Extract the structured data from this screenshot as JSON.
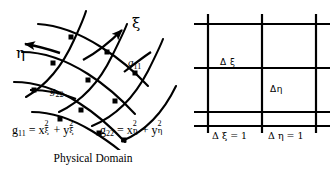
{
  "figure": {
    "background_color": "#ffffff",
    "ink_color": "#000000"
  },
  "physical_domain": {
    "caption": "Physical Domain",
    "axis_labels": {
      "xi": "ξ",
      "eta": "η"
    },
    "metric_labels": {
      "g11": "g",
      "g11_sub": "11",
      "g22": "g",
      "g22_sub": "22"
    },
    "grid": {
      "type": "curvilinear",
      "xi_lines": 4,
      "eta_lines": 4,
      "node_marker": "square"
    },
    "arrows": {
      "xi_direction": "up-right",
      "eta_direction": "left"
    }
  },
  "computational_space": {
    "caption": "Computational Space",
    "grid": {
      "type": "cartesian-uniform",
      "vertical_lines": 3,
      "horizontal_lines": 4
    },
    "spacing_labels": {
      "delta_xi": "Δ ξ",
      "delta_eta": "Δη"
    },
    "axis_equations": {
      "delta_xi_eq": "Δ ξ = 1",
      "delta_eta_eq": "Δ η = 1"
    }
  },
  "formulas": {
    "g11": {
      "lhs": "g",
      "lhs_sub": "11",
      "equals": "=",
      "term1_var": "x",
      "term1_sup": "2",
      "term1_sub": "ξ",
      "plus": "+",
      "term2_var": "y",
      "term2_sup": "2",
      "term2_sub": "ξ",
      "plain": "g11 = x²ξ + y²ξ"
    },
    "g22": {
      "lhs": "g",
      "lhs_sub": "22",
      "equals": "=",
      "term1_var": "x",
      "term1_sup": "2",
      "term1_sub": "η",
      "plus": "+",
      "term2_var": "y",
      "term2_sup": "2",
      "term2_sub": "η",
      "plain": "g22 = x²η + y²η"
    }
  }
}
